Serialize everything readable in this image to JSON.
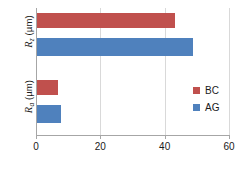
{
  "chart_data": {
    "type": "bar",
    "orientation": "horizontal",
    "title": "",
    "xlabel": "",
    "ylabel": "",
    "categories": [
      "Rz (µm)",
      "Ra (µm)"
    ],
    "series": [
      {
        "name": "BC",
        "color": "#C0504D",
        "values": [
          43,
          6.5
        ]
      },
      {
        "name": "AG",
        "color": "#4F81BD",
        "values": [
          48.5,
          7.5
        ]
      }
    ],
    "xlim": [
      0,
      60
    ],
    "xticks": [
      0,
      20,
      40,
      60
    ],
    "xtick_labels": [
      "0",
      "20",
      "40",
      "60"
    ],
    "grid": true,
    "grid_axis": "x",
    "legend_position": "right"
  },
  "axis": {
    "x": {
      "ticks": [
        {
          "label": "0",
          "value": 0
        },
        {
          "label": "20",
          "value": 20
        },
        {
          "label": "40",
          "value": 40
        },
        {
          "label": "60",
          "value": 60
        }
      ]
    },
    "y": {
      "categories": [
        {
          "symbol": "R",
          "subscript": "z",
          "unit": "(µm)"
        },
        {
          "symbol": "R",
          "subscript": "a",
          "unit": "(µm)"
        }
      ]
    }
  },
  "legend": {
    "items": [
      {
        "label": "BC",
        "color": "#C0504D"
      },
      {
        "label": "AG",
        "color": "#4F81BD"
      }
    ]
  },
  "colors": {
    "bc": "#C0504D",
    "ag": "#4F81BD",
    "grid": "#D9D9D9",
    "axis": "#A6A6A6",
    "text": "#1A1A1A",
    "background": "#FFFFFF"
  }
}
